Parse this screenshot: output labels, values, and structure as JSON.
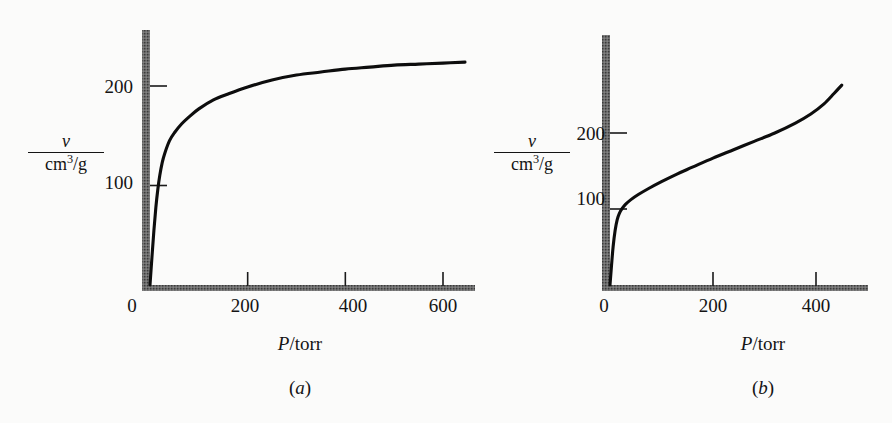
{
  "figure": {
    "background_color": "#fbfbfa",
    "ink_color": "#141414",
    "axis_color": "#5a5a5a",
    "curve_color": "#0d0d0d"
  },
  "panels": [
    {
      "id": "a",
      "caption_open": "(",
      "caption_letter": "a",
      "caption_close": ")",
      "x_axis_title_symbol": "P",
      "x_axis_title_rest": "/torr",
      "y_axis_numerator": "v",
      "y_axis_denominator_base": "cm",
      "y_axis_denominator_sup": "3",
      "y_axis_denominator_tail": "/g",
      "x_ticks": [
        {
          "label": "0",
          "value": 0
        },
        {
          "label": "200",
          "value": 200
        },
        {
          "label": "400",
          "value": 400
        },
        {
          "label": "600",
          "value": 600
        }
      ],
      "y_ticks": [
        {
          "label": "100",
          "value": 100
        },
        {
          "label": "200",
          "value": 200
        }
      ]
    },
    {
      "id": "b",
      "caption_open": "(",
      "caption_letter": "b",
      "caption_close": ")",
      "x_axis_title_symbol": "P",
      "x_axis_title_rest": "/torr",
      "y_axis_numerator": "v",
      "y_axis_denominator_base": "cm",
      "y_axis_denominator_sup": "3",
      "y_axis_denominator_tail": "/g",
      "x_ticks": [
        {
          "label": "0",
          "value": 0
        },
        {
          "label": "200",
          "value": 200
        },
        {
          "label": "400",
          "value": 400
        }
      ],
      "y_ticks": [
        {
          "label": "100",
          "value": 100
        },
        {
          "label": "200",
          "value": 200
        }
      ]
    }
  ],
  "chart_data": [
    {
      "type": "line",
      "panel": "a",
      "title": "(a)",
      "xlabel": "P/torr",
      "ylabel": "v/cm^3/g",
      "xlim": [
        0,
        650
      ],
      "ylim": [
        0,
        265
      ],
      "grid": false,
      "legend": "none",
      "xticks": [
        0,
        200,
        400,
        600
      ],
      "yticks": [
        100,
        200
      ],
      "description": "Type I (Langmuir) adsorption isotherm: steep initial rise then plateau near 225 cm^3/g",
      "x": [
        0,
        4,
        8,
        12,
        16,
        20,
        25,
        30,
        40,
        50,
        65,
        80,
        100,
        130,
        160,
        200,
        250,
        300,
        350,
        400,
        450,
        500,
        550,
        600,
        645
      ],
      "y": [
        0,
        28,
        55,
        78,
        96,
        110,
        123,
        132,
        145,
        153,
        162,
        169,
        177,
        186,
        192,
        199,
        206,
        211,
        214,
        217,
        219,
        221,
        222,
        223,
        224
      ]
    },
    {
      "type": "line",
      "panel": "b",
      "title": "(b)",
      "xlabel": "P/torr",
      "ylabel": "v/cm^3/g",
      "xlim": [
        0,
        500
      ],
      "ylim": [
        0,
        280
      ],
      "grid": false,
      "legend": "none",
      "xticks": [
        0,
        200,
        400
      ],
      "yticks": [
        100,
        200
      ],
      "description": "Type II (BET) adsorption isotherm: steep knee near 100 cm^3/g, long near-linear middle, upturn at high pressure",
      "x": [
        0,
        3,
        6,
        10,
        14,
        18,
        24,
        30,
        40,
        55,
        75,
        100,
        130,
        160,
        200,
        240,
        280,
        320,
        360,
        390,
        415,
        435,
        450
      ],
      "y": [
        0,
        26,
        50,
        72,
        86,
        94,
        101,
        106,
        112,
        119,
        127,
        136,
        146,
        155,
        167,
        178,
        189,
        200,
        213,
        225,
        238,
        252,
        263
      ]
    }
  ]
}
